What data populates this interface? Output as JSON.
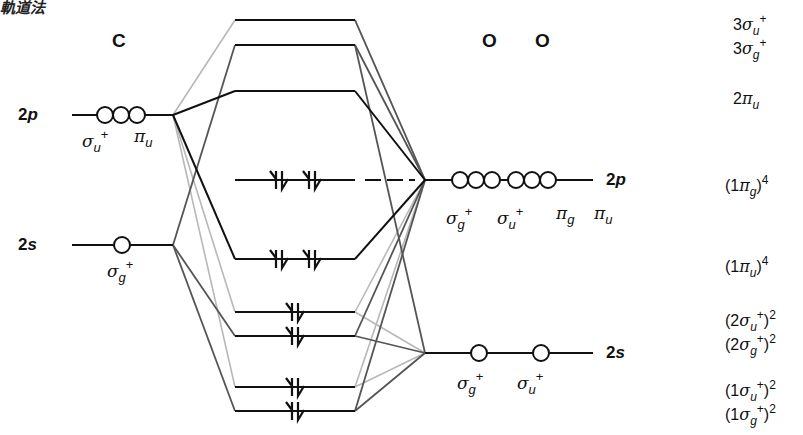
{
  "title_fragment": "軌道法",
  "atoms": {
    "carbon": {
      "label": "C",
      "shells": [
        {
          "name": "2p",
          "num": "2",
          "letter": "p",
          "orbitals": [
            {
              "sym": "σ",
              "sub": "u",
              "sup": "+"
            },
            {
              "sym": "π",
              "sub": "u",
              "sup": ""
            }
          ]
        },
        {
          "name": "2s",
          "num": "2",
          "letter": "s",
          "orbitals": [
            {
              "sym": "σ",
              "sub": "g",
              "sup": "+"
            }
          ]
        }
      ]
    },
    "oxygen_pair": {
      "labels": [
        "O",
        "O"
      ],
      "shells": [
        {
          "name": "2p",
          "num": "2",
          "letter": "p",
          "orbitals": [
            {
              "sym": "σ",
              "sub": "g",
              "sup": "+"
            },
            {
              "sym": "σ",
              "sub": "u",
              "sup": "+"
            },
            {
              "sym": "π",
              "sub": "g",
              "sup": ""
            },
            {
              "sym": "π",
              "sub": "u",
              "sup": ""
            }
          ]
        },
        {
          "name": "2s",
          "num": "2",
          "letter": "s",
          "orbitals": [
            {
              "sym": "σ",
              "sub": "g",
              "sup": "+"
            },
            {
              "sym": "σ",
              "sub": "u",
              "sup": "+"
            }
          ]
        }
      ]
    }
  },
  "molecular_orbitals": [
    {
      "id": "3su",
      "prefix": "3",
      "sym": "σ",
      "sub": "u",
      "sup": "+",
      "occupancy": "",
      "electrons": 0,
      "y": 20
    },
    {
      "id": "3sg",
      "prefix": "3",
      "sym": "σ",
      "sub": "g",
      "sup": "+",
      "occupancy": "",
      "electrons": 0,
      "y": 45
    },
    {
      "id": "2pu",
      "prefix": "2",
      "sym": "π",
      "sub": "u",
      "sup": "",
      "occupancy": "",
      "electrons": 0,
      "y": 91
    },
    {
      "id": "1pg",
      "prefix": "1",
      "sym": "π",
      "sub": "g",
      "sup": "",
      "occupancy": "4",
      "electrons": 4,
      "y": 180
    },
    {
      "id": "1pu",
      "prefix": "1",
      "sym": "π",
      "sub": "u",
      "sup": "",
      "occupancy": "4",
      "electrons": 4,
      "y": 259
    },
    {
      "id": "2su",
      "prefix": "2",
      "sym": "σ",
      "sub": "u",
      "sup": "+",
      "occupancy": "2",
      "electrons": 2,
      "y": 312
    },
    {
      "id": "2sg",
      "prefix": "2",
      "sym": "σ",
      "sub": "g",
      "sup": "+",
      "occupancy": "2",
      "electrons": 2,
      "y": 336
    },
    {
      "id": "1su",
      "prefix": "1",
      "sym": "σ",
      "sub": "u",
      "sup": "+",
      "occupancy": "2",
      "electrons": 2,
      "y": 387
    },
    {
      "id": "1sg",
      "prefix": "1",
      "sym": "σ",
      "sub": "g",
      "sup": "+",
      "occupancy": "2",
      "electrons": 2,
      "y": 411
    }
  ],
  "colors": {
    "dark": "#111111",
    "mid": "#555555",
    "light": "#b4b4b4"
  }
}
